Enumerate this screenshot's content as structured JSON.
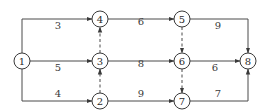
{
  "diagram": {
    "type": "activity-on-arrow network",
    "nodes": [
      {
        "id": "1",
        "label": "1",
        "x": 22,
        "y": 61
      },
      {
        "id": "2",
        "label": "2",
        "x": 100,
        "y": 101
      },
      {
        "id": "3",
        "label": "3",
        "x": 100,
        "y": 61
      },
      {
        "id": "4",
        "label": "4",
        "x": 100,
        "y": 19
      },
      {
        "id": "5",
        "label": "5",
        "x": 182,
        "y": 19
      },
      {
        "id": "6",
        "label": "6",
        "x": 182,
        "y": 61
      },
      {
        "id": "7",
        "label": "7",
        "x": 182,
        "y": 101
      },
      {
        "id": "8",
        "label": "8",
        "x": 248,
        "y": 61
      }
    ],
    "edges": [
      {
        "from": "1",
        "to": "4",
        "duration": "3",
        "style": "solid"
      },
      {
        "from": "1",
        "to": "3",
        "duration": "5",
        "style": "solid"
      },
      {
        "from": "1",
        "to": "2",
        "duration": "4",
        "style": "solid"
      },
      {
        "from": "3",
        "to": "4",
        "duration": "",
        "style": "dashed"
      },
      {
        "from": "2",
        "to": "3",
        "duration": "",
        "style": "dashed"
      },
      {
        "from": "4",
        "to": "5",
        "duration": "6",
        "style": "solid"
      },
      {
        "from": "3",
        "to": "6",
        "duration": "8",
        "style": "solid"
      },
      {
        "from": "2",
        "to": "7",
        "duration": "9",
        "style": "solid"
      },
      {
        "from": "5",
        "to": "6",
        "duration": "",
        "style": "dashed"
      },
      {
        "from": "6",
        "to": "7",
        "duration": "",
        "style": "dashed"
      },
      {
        "from": "5",
        "to": "8",
        "duration": "9",
        "style": "solid"
      },
      {
        "from": "6",
        "to": "8",
        "duration": "6",
        "style": "solid"
      },
      {
        "from": "7",
        "to": "8",
        "duration": "7",
        "style": "solid"
      }
    ]
  },
  "labels": {
    "e14": "3",
    "e13": "5",
    "e12": "4",
    "e45": "6",
    "e36": "8",
    "e27": "9",
    "e58": "9",
    "e68": "6",
    "e78": "7"
  },
  "node_labels": {
    "n1": "1",
    "n2": "2",
    "n3": "3",
    "n4": "4",
    "n5": "5",
    "n6": "6",
    "n7": "7",
    "n8": "8"
  }
}
